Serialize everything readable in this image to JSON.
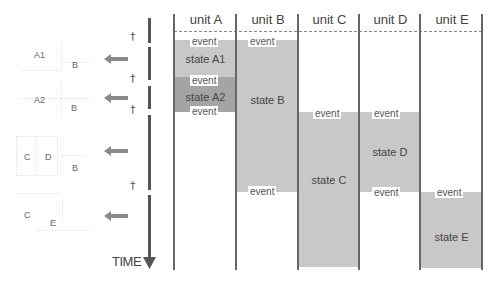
{
  "units": [
    {
      "label": "unit A"
    },
    {
      "label": "unit B"
    },
    {
      "label": "unit C"
    },
    {
      "label": "unit D"
    },
    {
      "label": "unit E"
    }
  ],
  "states": {
    "A1": "state A1",
    "A2": "state A2",
    "B": "state B",
    "C": "state C",
    "D": "state D",
    "E": "state E"
  },
  "event_label": "event",
  "events": {
    "a_top": "event",
    "a_mid": "event",
    "a_bottom": "event",
    "b_top": "event",
    "b_bottom": "event",
    "c_top": "event",
    "d_top": "event",
    "d_bottom": "event",
    "e_top": "event"
  },
  "time_axis": {
    "label": "TIME",
    "dagger": "†"
  },
  "sketches": [
    {
      "labels": [
        "A1",
        "B"
      ]
    },
    {
      "labels": [
        "A2",
        "B"
      ]
    },
    {
      "labels": [
        "C",
        "D",
        "B"
      ]
    },
    {
      "labels": [
        "C",
        "E"
      ]
    }
  ],
  "colors": {
    "state_fill": "#c8c8c8",
    "state_fill_dark": "#a4a4a4",
    "axis": "#555555",
    "arrow": "#8a8a8a"
  }
}
